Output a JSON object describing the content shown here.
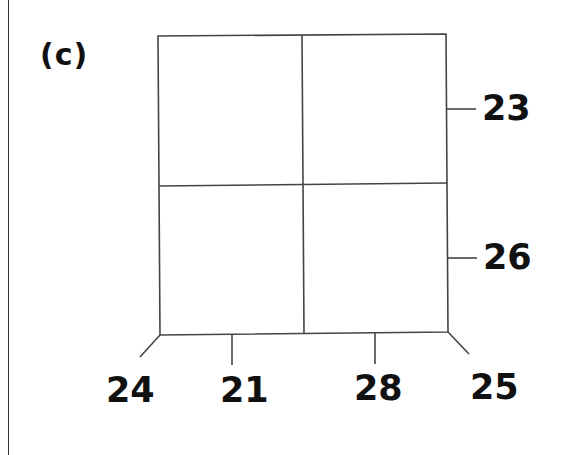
{
  "panel": {
    "label": "(c)"
  },
  "diagram": {
    "right_labels": [
      "23",
      "26"
    ],
    "bottom_labels": [
      "24",
      "21",
      "28",
      "25"
    ],
    "line_color": "#444444",
    "text_color": "#111111"
  }
}
